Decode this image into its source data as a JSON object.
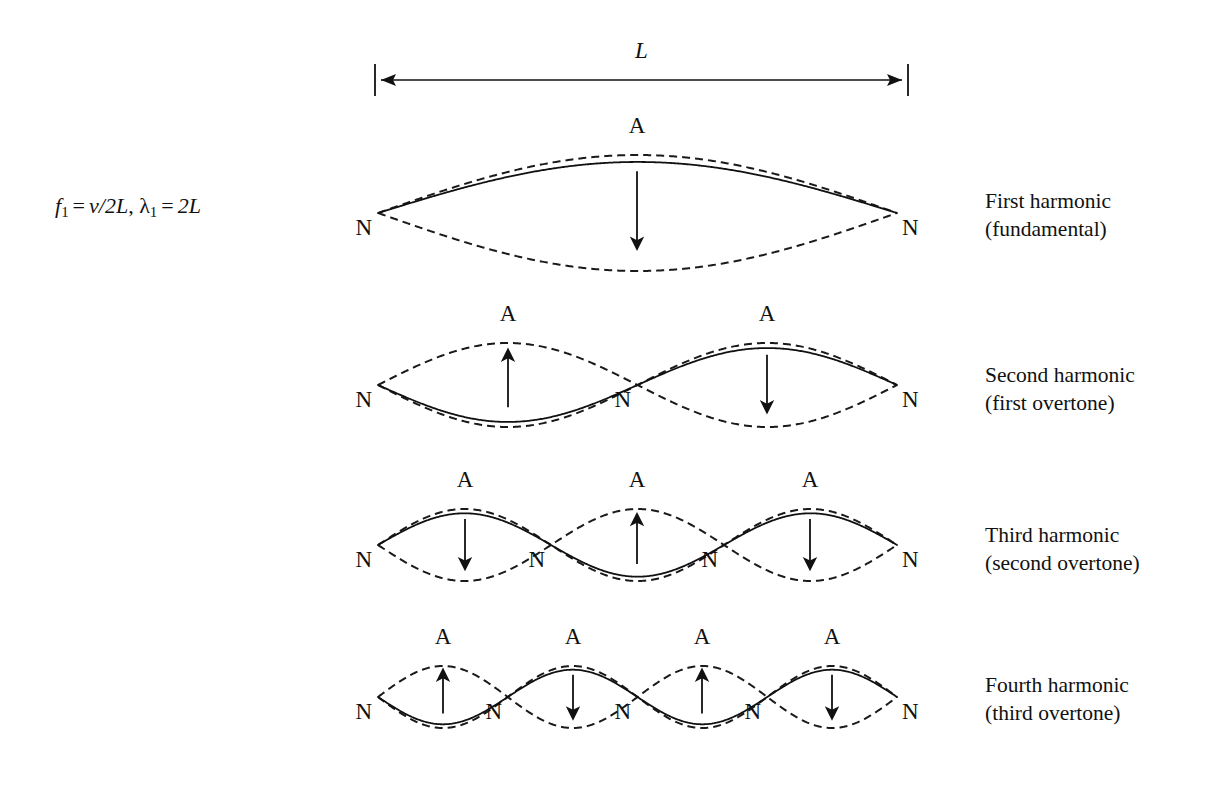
{
  "figure": {
    "background_color": "#ffffff",
    "ink_color": "#111111"
  },
  "formula": {
    "f_symbol": "f",
    "f_subscript": "1",
    "equals_1": "=",
    "f_value": "v/2L",
    "comma": ",",
    "lambda_symbol": "λ",
    "lambda_subscript": "1",
    "equals_2": "=",
    "lambda_value": "2L",
    "full_text": "f₁ = v/2L, λ₁ = 2L"
  },
  "dimension": {
    "label": "L",
    "x_start": 375,
    "x_end": 908,
    "y": 80,
    "tick_half_height": 16,
    "arrow": "double-headed"
  },
  "labels": {
    "node": "N",
    "antinode": "A"
  },
  "harmonics": [
    {
      "name": "first-harmonic",
      "title": "First harmonic",
      "subtitle": "(fundamental)",
      "loops": 1,
      "nodes": 2,
      "antinodes": 1,
      "baseline_y": 213,
      "amplitude": 58,
      "x_start": 378,
      "x_end": 897,
      "solid_phase": "up",
      "arrow_directions": [
        "down"
      ],
      "node_positions_x": [
        378,
        897
      ],
      "antinode_positions_x": [
        637
      ]
    },
    {
      "name": "second-harmonic",
      "title": "Second harmonic",
      "subtitle": "(first overtone)",
      "loops": 2,
      "nodes": 3,
      "antinodes": 2,
      "baseline_y": 385,
      "amplitude": 42,
      "x_start": 378,
      "x_end": 897,
      "solid_phase": "down",
      "arrow_directions": [
        "up",
        "down"
      ],
      "node_positions_x": [
        378,
        637,
        897
      ],
      "antinode_positions_x": [
        508,
        767
      ]
    },
    {
      "name": "third-harmonic",
      "title": "Third harmonic",
      "subtitle": "(second overtone)",
      "loops": 3,
      "nodes": 4,
      "antinodes": 3,
      "baseline_y": 545,
      "amplitude": 36,
      "x_start": 378,
      "x_end": 897,
      "solid_phase": "up",
      "arrow_directions": [
        "down",
        "up",
        "down"
      ],
      "node_positions_x": [
        378,
        551,
        724,
        897
      ],
      "antinode_positions_x": [
        465,
        637,
        810
      ]
    },
    {
      "name": "fourth-harmonic",
      "title": "Fourth harmonic",
      "subtitle": "(third overtone)",
      "loops": 4,
      "nodes": 5,
      "antinodes": 4,
      "baseline_y": 697,
      "amplitude": 31,
      "x_start": 378,
      "x_end": 897,
      "solid_phase": "down",
      "arrow_directions": [
        "up",
        "down",
        "up",
        "down"
      ],
      "node_positions_x": [
        378,
        508,
        637,
        767,
        897
      ],
      "antinode_positions_x": [
        443,
        573,
        702,
        832
      ]
    }
  ],
  "style": {
    "solid_stroke_width": 1.8,
    "dashed_stroke_width": 2.0,
    "dash_pattern": "8,5",
    "arrow_stroke_width": 1.8
  }
}
